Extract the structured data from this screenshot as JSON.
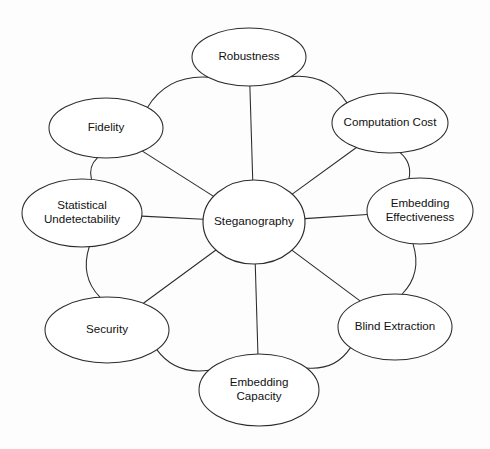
{
  "diagram": {
    "type": "hub-and-spoke concept map",
    "background_color": "#fdfdfd",
    "stroke_color": "#2b2b2b",
    "text_color": "#111111",
    "center": {
      "id": "steganography",
      "label": "Steganography",
      "cx": 254,
      "cy": 222,
      "rx": 51,
      "ry": 42
    },
    "nodes": [
      {
        "id": "robustness",
        "label_line1": "Robustness",
        "label_line2": "",
        "cx": 249,
        "cy": 57,
        "rx": 57,
        "ry": 29
      },
      {
        "id": "computation-cost",
        "label_line1": "Computation Cost",
        "label_line2": "",
        "cx": 390,
        "cy": 123,
        "rx": 58,
        "ry": 30
      },
      {
        "id": "embedding-effectiveness",
        "label_line1": "Embedding",
        "label_line2": "Effectiveness",
        "cx": 420,
        "cy": 211,
        "rx": 53,
        "ry": 33
      },
      {
        "id": "blind-extraction",
        "label_line1": "Blind Extraction",
        "label_line2": "",
        "cx": 395,
        "cy": 327,
        "rx": 57,
        "ry": 33
      },
      {
        "id": "embedding-capacity",
        "label_line1": "Embedding",
        "label_line2": "Capacity",
        "cx": 259,
        "cy": 390,
        "rx": 60,
        "ry": 36
      },
      {
        "id": "security",
        "label_line1": "Security",
        "label_line2": "",
        "cx": 107,
        "cy": 330,
        "rx": 62,
        "ry": 33
      },
      {
        "id": "statistical-undetectability",
        "label_line1": "Statistical",
        "label_line2": "Undetectability",
        "cx": 82,
        "cy": 213,
        "rx": 60,
        "ry": 34
      },
      {
        "id": "fidelity",
        "label_line1": "Fidelity",
        "label_line2": "",
        "cx": 106,
        "cy": 128,
        "rx": 57,
        "ry": 30
      }
    ],
    "spokes": [
      {
        "from": "steganography",
        "to": "robustness"
      },
      {
        "from": "steganography",
        "to": "computation-cost"
      },
      {
        "from": "steganography",
        "to": "embedding-effectiveness"
      },
      {
        "from": "steganography",
        "to": "blind-extraction"
      },
      {
        "from": "steganography",
        "to": "embedding-capacity"
      },
      {
        "from": "steganography",
        "to": "security"
      },
      {
        "from": "steganography",
        "to": "statistical-undetectability"
      },
      {
        "from": "steganography",
        "to": "fidelity"
      }
    ],
    "ring_edges": [
      {
        "from": "robustness",
        "to": "computation-cost"
      },
      {
        "from": "computation-cost",
        "to": "embedding-effectiveness"
      },
      {
        "from": "embedding-effectiveness",
        "to": "blind-extraction"
      },
      {
        "from": "blind-extraction",
        "to": "embedding-capacity"
      },
      {
        "from": "embedding-capacity",
        "to": "security"
      },
      {
        "from": "security",
        "to": "statistical-undetectability"
      },
      {
        "from": "statistical-undetectability",
        "to": "fidelity"
      },
      {
        "from": "fidelity",
        "to": "robustness"
      }
    ]
  }
}
